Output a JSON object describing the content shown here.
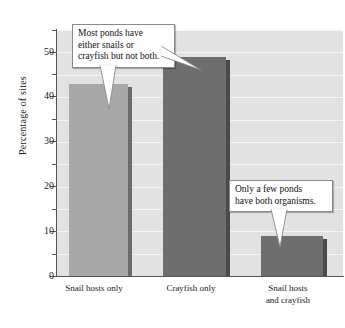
{
  "chart_data": {
    "type": "bar",
    "title": "",
    "xlabel": "",
    "ylabel": "Percentage of sites",
    "categories": [
      "Snail hosts only",
      "Crayfish only",
      "Snail hosts\nand crayfish"
    ],
    "values": [
      43,
      49,
      9
    ],
    "ylim": [
      0,
      55
    ],
    "yticks_major": [
      0,
      10,
      20,
      30,
      40,
      50
    ],
    "yticks_minor": [
      5,
      15,
      25,
      35,
      45,
      55
    ],
    "ytick_labels": [
      "0",
      "10",
      "20",
      "30",
      "40",
      "50"
    ],
    "grid": true,
    "grid_color": "#f7f7f7",
    "plot_background": "#e2e2e2",
    "legend": "none",
    "bar_colors": [
      "#a8a8a8",
      "#6e6e6e",
      "#6e6e6e"
    ],
    "bar_side_colors": [
      "#6b6b6b",
      "#4a4a4a",
      "#4a4a4a"
    ],
    "annotations": [
      {
        "id": "callout-1",
        "text": "Most ponds have\neither snails or\ncrayfish but not both.",
        "points_to": "Snail hosts only"
      },
      {
        "id": "callout-2",
        "text": "Only a few ponds\nhave both organisms.",
        "points_to": "Snail hosts and crayfish"
      }
    ]
  },
  "axis": {
    "y_label": "Percentage of sites"
  }
}
